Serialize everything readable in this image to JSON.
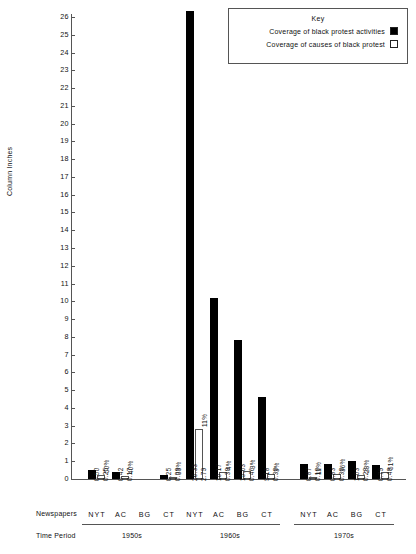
{
  "chart": {
    "ylabel": "Column Inches",
    "yticks": [
      0,
      1,
      2,
      3,
      4,
      5,
      6,
      7,
      8,
      9,
      10,
      11,
      12,
      13,
      14,
      15,
      16,
      17,
      18,
      19,
      20,
      21,
      22,
      23,
      24,
      25,
      26
    ],
    "newspapers_row_label": "Newspapers",
    "time_period_row_label": "Time Period"
  },
  "legend": {
    "title": "Key",
    "items": [
      {
        "label": "Coverage of black protest activities",
        "swatch": "filled",
        "color": "#000000"
      },
      {
        "label": "Coverage of causes of black protest",
        "swatch": "hollow",
        "color": "#ffffff"
      }
    ]
  },
  "chart_data": {
    "type": "bar",
    "title": "",
    "xlabel": "Newspapers",
    "ylabel": "Column Inches",
    "ylim": [
      0,
      26
    ],
    "grid": false,
    "legend_position": "top-right",
    "categories": [
      "NYT",
      "AC",
      "BG",
      "CT",
      "NYT",
      "AC",
      "BG",
      "CT",
      "NYT",
      "AC",
      "BG",
      "CT"
    ],
    "groups": [
      {
        "period": "1950s",
        "bars": [
          {
            "newspaper": "NYT",
            "activities": 0.5,
            "causes": 0.25,
            "percent": "50%",
            "activities_label": "0.50",
            "causes_label": "0.25"
          },
          {
            "newspaper": "AC",
            "activities": 0.42,
            "causes": 0.17,
            "percent": "40%",
            "activities_label": "0.42",
            "causes_label": "0.17"
          },
          {
            "newspaper": "BG",
            "activities": null,
            "causes": null,
            "percent": "",
            "activities_label": "",
            "causes_label": ""
          },
          {
            "newspaper": "CT",
            "activities": 0.25,
            "causes": 0.08,
            "percent": "33%",
            "activities_label": "0.25",
            "causes_label": "0.08"
          }
        ]
      },
      {
        "period": "1960s",
        "bars": [
          {
            "newspaper": "NYT",
            "activities": 26.33,
            "causes": 2.79,
            "percent": "11%",
            "activities_label": "26.33",
            "causes_label": "2.79"
          },
          {
            "newspaper": "AC",
            "activities": 10.17,
            "causes": 0.38,
            "percent": "4%",
            "activities_label": "10.17",
            "causes_label": "0.38"
          },
          {
            "newspaper": "BG",
            "activities": 7.83,
            "causes": 0.46,
            "percent": "3%",
            "activities_label": "15.63",
            "causes_label": "0.46"
          },
          {
            "newspaper": "CT",
            "activities": 4.6,
            "causes": 0.3,
            "percent": "3%",
            "activities_label": "9.18",
            "causes_label": "0.30"
          }
        ]
      },
      {
        "period": "1970s",
        "bars": [
          {
            "newspaper": "NYT",
            "activities": 0.87,
            "causes": 0.1,
            "percent": "11%",
            "activities_label": "0.87",
            "causes_label": "0.10"
          },
          {
            "newspaper": "AC",
            "activities": 0.83,
            "causes": 0.3,
            "percent": "36%",
            "activities_label": "0.83",
            "causes_label": "0.30"
          },
          {
            "newspaper": "BG",
            "activities": 1.03,
            "causes": 0.23,
            "percent": "23%",
            "activities_label": "1.03",
            "causes_label": "0.23"
          },
          {
            "newspaper": "CT",
            "activities": 0.79,
            "causes": 0.4,
            "percent": "51%",
            "activities_label": "0.79",
            "causes_label": "0.40"
          }
        ]
      }
    ],
    "series": [
      {
        "name": "Coverage of black protest activities",
        "values": [
          0.5,
          0.42,
          null,
          0.25,
          26.33,
          10.17,
          7.83,
          4.6,
          0.87,
          0.83,
          1.03,
          0.79
        ]
      },
      {
        "name": "Coverage of causes of black protest",
        "values": [
          0.25,
          0.17,
          null,
          0.08,
          2.79,
          0.38,
          0.46,
          0.3,
          0.1,
          0.3,
          0.23,
          0.4
        ]
      }
    ]
  }
}
